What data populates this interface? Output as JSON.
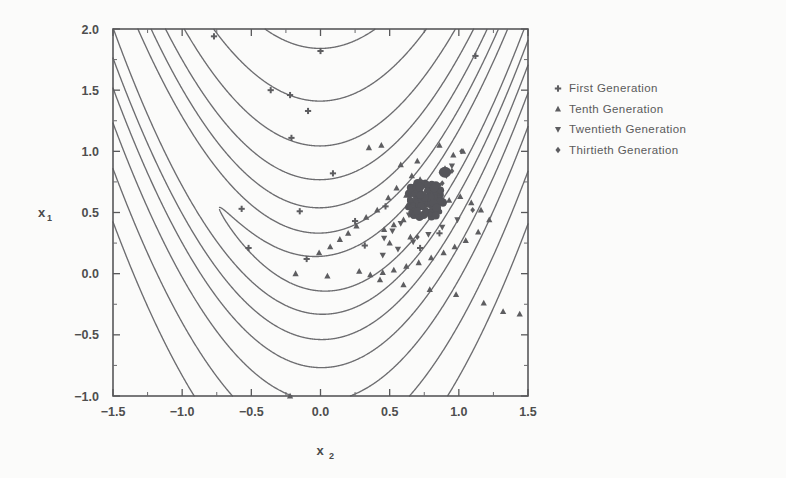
{
  "chart_data": {
    "type": "scatter",
    "title": "",
    "subtitle": "",
    "xlabel": "x",
    "xlabel_sub": "2",
    "ylabel": "x",
    "ylabel_sub": "1",
    "xlim": [
      -1.5,
      1.5
    ],
    "ylim": [
      -1.0,
      2.0
    ],
    "xticks": [
      -1.5,
      -1.0,
      -0.5,
      0.0,
      0.5,
      1.0,
      1.5
    ],
    "xtick_labels": [
      "-1.5",
      "-1.0",
      "-0.5",
      "0.0",
      "0.5",
      "1.0",
      "1.5"
    ],
    "yticks": [
      -1.0,
      -0.5,
      0.0,
      0.5,
      1.0,
      1.5,
      2.0
    ],
    "ytick_labels": [
      "-1.0",
      "-0.5",
      "0.0",
      "0.5",
      "1.0",
      "1.5",
      "2.0"
    ],
    "minor_tick_step": 0.25,
    "grid": false,
    "legend_position": "right-outside",
    "background_function": "Rosenbrock banana function contours",
    "contour_levels": [
      3,
      12,
      30,
      60,
      110,
      200,
      340
    ],
    "series": [
      {
        "name": "First Generation",
        "marker": "plus",
        "color": "#5d5d60",
        "points": [
          [
            -0.77,
            1.94
          ],
          [
            -0.36,
            1.5
          ],
          [
            -0.22,
            1.46
          ],
          [
            -0.09,
            1.33
          ],
          [
            0.0,
            1.82
          ],
          [
            -0.21,
            1.11
          ],
          [
            0.09,
            0.82
          ],
          [
            -0.57,
            0.53
          ],
          [
            -0.52,
            0.21
          ],
          [
            -0.15,
            0.51
          ],
          [
            0.25,
            0.43
          ],
          [
            0.47,
            0.55
          ],
          [
            0.77,
            0.61
          ],
          [
            0.86,
            0.33
          ],
          [
            1.12,
            1.78
          ],
          [
            0.32,
            0.23
          ],
          [
            0.72,
            0.21
          ],
          [
            -0.1,
            0.12
          ]
        ]
      },
      {
        "name": "Tenth Generation",
        "marker": "triangle-up",
        "color": "#5d5d60",
        "points": [
          [
            0.35,
            1.03
          ],
          [
            0.44,
            1.05
          ],
          [
            0.58,
            0.89
          ],
          [
            0.66,
            0.8
          ],
          [
            0.72,
            0.77
          ],
          [
            0.55,
            0.7
          ],
          [
            0.49,
            0.62
          ],
          [
            0.62,
            0.64
          ],
          [
            0.75,
            0.66
          ],
          [
            0.83,
            0.72
          ],
          [
            0.9,
            0.86
          ],
          [
            0.96,
            0.97
          ],
          [
            1.03,
            1.0
          ],
          [
            0.41,
            0.52
          ],
          [
            0.33,
            0.46
          ],
          [
            0.26,
            0.39
          ],
          [
            0.2,
            0.33
          ],
          [
            0.14,
            0.28
          ],
          [
            0.07,
            0.22
          ],
          [
            -0.01,
            0.17
          ],
          [
            0.46,
            0.36
          ],
          [
            0.53,
            0.4
          ],
          [
            0.6,
            0.44
          ],
          [
            0.68,
            0.47
          ],
          [
            0.76,
            0.51
          ],
          [
            0.85,
            0.56
          ],
          [
            0.93,
            0.6
          ],
          [
            1.01,
            0.63
          ],
          [
            1.09,
            0.58
          ],
          [
            1.16,
            0.52
          ],
          [
            1.22,
            0.44
          ],
          [
            1.14,
            0.34
          ],
          [
            1.05,
            0.27
          ],
          [
            0.97,
            0.22
          ],
          [
            0.89,
            0.17
          ],
          [
            0.8,
            0.13
          ],
          [
            0.71,
            0.09
          ],
          [
            0.62,
            0.06
          ],
          [
            0.53,
            0.03
          ],
          [
            0.45,
            0.01
          ],
          [
            0.36,
            -0.01
          ],
          [
            0.28,
            0.02
          ],
          [
            0.43,
            -0.05
          ],
          [
            0.6,
            -0.09
          ],
          [
            0.79,
            -0.13
          ],
          [
            0.98,
            -0.17
          ],
          [
            1.18,
            -0.24
          ],
          [
            1.32,
            -0.31
          ],
          [
            1.44,
            -0.33
          ],
          [
            -0.22,
            -1.0
          ],
          [
            -0.18,
            0.0
          ],
          [
            0.05,
            -0.02
          ],
          [
            0.7,
            0.92
          ],
          [
            0.86,
            1.05
          ],
          [
            0.5,
            0.25
          ],
          [
            0.65,
            0.3
          ]
        ]
      },
      {
        "name": "Twentieth Generation",
        "marker": "triangle-down",
        "color": "#5d5d60",
        "points": [
          [
            0.76,
            0.6
          ],
          [
            0.81,
            0.66
          ],
          [
            0.7,
            0.55
          ],
          [
            0.86,
            0.72
          ],
          [
            0.64,
            0.48
          ],
          [
            0.91,
            0.8
          ],
          [
            0.58,
            0.41
          ],
          [
            0.95,
            0.88
          ],
          [
            0.52,
            0.35
          ],
          [
            0.46,
            0.29
          ],
          [
            0.99,
            0.44
          ],
          [
            0.88,
            0.38
          ],
          [
            0.78,
            0.32
          ],
          [
            0.67,
            0.26
          ],
          [
            0.56,
            0.2
          ],
          [
            0.45,
            0.15
          ]
        ]
      },
      {
        "name": "Thirtieth Generation",
        "marker": "diamond",
        "color": "#5d5d60",
        "points": [
          [
            0.78,
            0.62
          ],
          [
            0.8,
            0.64
          ],
          [
            0.75,
            0.59
          ],
          [
            0.82,
            0.67
          ],
          [
            0.73,
            0.56
          ],
          [
            1.02,
            1.0
          ],
          [
            0.95,
            0.84
          ],
          [
            0.88,
            0.74
          ],
          [
            1.1,
            0.52
          ],
          [
            0.7,
            0.3
          ]
        ]
      }
    ],
    "converged_cluster": {
      "description": "dense overlapping cluster of converged individuals near the optimum",
      "center": [
        0.77,
        0.6
      ],
      "approx_extent_x": 0.22,
      "approx_extent_y": 0.25
    }
  },
  "legend": {
    "entries": [
      {
        "marker": "plus",
        "label": "First Generation"
      },
      {
        "marker": "triangle-up",
        "label": "Tenth Generation"
      },
      {
        "marker": "triangle-down",
        "label": "Twentieth Generation"
      },
      {
        "marker": "diamond",
        "label": "Thirtieth Generation"
      }
    ]
  },
  "colors": {
    "background": "#fbfbfa",
    "ink": "#58585a",
    "contour": "#6d6d70",
    "marker": "#5d5d60"
  }
}
